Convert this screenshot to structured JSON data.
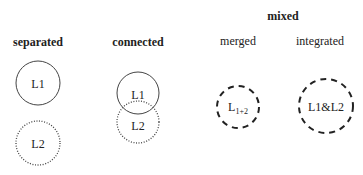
{
  "diagram": {
    "groups": [
      {
        "title": "separated",
        "circles": [
          {
            "label": "L1",
            "style": "solid"
          },
          {
            "label": "L2",
            "style": "dotted"
          }
        ]
      },
      {
        "title": "connected",
        "circles": [
          {
            "label": "L1",
            "style": "solid"
          },
          {
            "label": "L2",
            "style": "dotted"
          }
        ]
      },
      {
        "title": "mixed",
        "subgroups": [
          {
            "title": "merged",
            "circle": {
              "label": "L",
              "subscript": "1+2",
              "style": "dashed"
            }
          },
          {
            "title": "integrated",
            "circle": {
              "label": "L1&L2",
              "style": "dashed"
            }
          }
        ]
      }
    ]
  }
}
